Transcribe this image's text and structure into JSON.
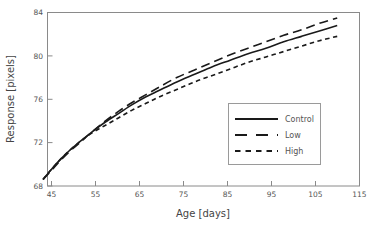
{
  "chart_data": {
    "type": "line",
    "title": "",
    "xlabel": "Age [days]",
    "ylabel": "Response [pixels]",
    "xlim": [
      45,
      115
    ],
    "ylim": [
      68,
      84
    ],
    "xticks": [
      45,
      55,
      65,
      75,
      85,
      95,
      105,
      115
    ],
    "yticks": [
      68,
      72,
      76,
      80,
      84
    ],
    "grid": false,
    "legend_position": "lower right",
    "x": [
      44,
      46,
      48,
      50,
      52,
      55,
      58,
      61,
      64,
      67,
      70,
      74,
      78,
      82,
      86,
      90,
      94,
      98,
      102,
      106,
      110
    ],
    "series": [
      {
        "name": "Control",
        "style": "solid",
        "values": [
          68.6,
          69.6,
          70.5,
          71.3,
          72.0,
          73.0,
          73.9,
          74.7,
          75.5,
          76.2,
          76.8,
          77.6,
          78.3,
          79.0,
          79.6,
          80.2,
          80.7,
          81.3,
          81.8,
          82.3,
          82.8
        ]
      },
      {
        "name": "Low",
        "style": "long-dash",
        "values": [
          68.6,
          69.5,
          70.4,
          71.2,
          71.9,
          73.0,
          74.0,
          74.9,
          75.7,
          76.4,
          77.1,
          78.0,
          78.7,
          79.4,
          80.1,
          80.7,
          81.3,
          81.9,
          82.4,
          83.0,
          83.5
        ]
      },
      {
        "name": "High",
        "style": "short-dash",
        "values": [
          68.6,
          69.6,
          70.5,
          71.3,
          72.0,
          72.9,
          73.6,
          74.3,
          75.0,
          75.6,
          76.2,
          76.9,
          77.6,
          78.2,
          78.8,
          79.4,
          79.9,
          80.4,
          80.9,
          81.4,
          81.8
        ]
      }
    ]
  },
  "legend": {
    "items": [
      {
        "label": "Control"
      },
      {
        "label": "Low"
      },
      {
        "label": "High"
      }
    ]
  },
  "axes": {
    "x_title": "Age [days]",
    "y_title": "Response [pixels]",
    "x_tick_labels": [
      "45",
      "55",
      "65",
      "75",
      "85",
      "95",
      "105",
      "115"
    ],
    "y_tick_labels": [
      "68",
      "72",
      "76",
      "80",
      "84"
    ]
  },
  "colors": {
    "line": "#1a1a1a",
    "frame": "#8a8a8a",
    "text": "#555555",
    "background": "#ffffff"
  }
}
